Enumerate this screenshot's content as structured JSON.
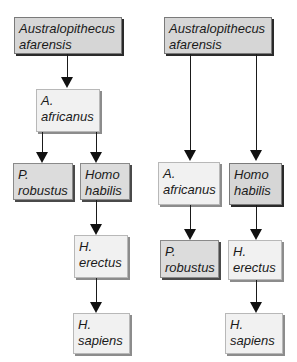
{
  "diagram": {
    "left_tree": {
      "root": {
        "line1": "Australopithecus",
        "line2": "afarensis"
      },
      "africanus": {
        "line1": "A.",
        "line2": "africanus"
      },
      "robustus": {
        "line1": "P.",
        "line2": "robustus"
      },
      "habilis": {
        "line1": "Homo",
        "line2": "habilis"
      },
      "erectus": {
        "line1": "H.",
        "line2": "erectus"
      },
      "sapiens": {
        "line1": "H.",
        "line2": "sapiens"
      },
      "edges": [
        [
          "Australopithecus afarensis",
          "A. africanus"
        ],
        [
          "A. africanus",
          "P. robustus"
        ],
        [
          "A. africanus",
          "Homo habilis"
        ],
        [
          "Homo habilis",
          "H. erectus"
        ],
        [
          "H. erectus",
          "H. sapiens"
        ]
      ]
    },
    "right_tree": {
      "root": {
        "line1": "Australopithecus",
        "line2": "afarensis"
      },
      "africanus": {
        "line1": "A.",
        "line2": "africanus"
      },
      "habilis": {
        "line1": "Homo",
        "line2": "habilis"
      },
      "robustus": {
        "line1": "P.",
        "line2": "robustus"
      },
      "erectus": {
        "line1": "H.",
        "line2": "erectus"
      },
      "sapiens": {
        "line1": "H.",
        "line2": "sapiens"
      },
      "edges": [
        [
          "Australopithecus afarensis",
          "A. africanus"
        ],
        [
          "Australopithecus afarensis",
          "Homo habilis"
        ],
        [
          "A. africanus",
          "P. robustus"
        ],
        [
          "Homo habilis",
          "H. erectus"
        ],
        [
          "H. erectus",
          "H. sapiens"
        ]
      ]
    },
    "colors": {
      "dark_box_fill": "#d6d6d6",
      "light_box_fill": "#f1f1f1",
      "line": "#1a1a1a",
      "background": "#ffffff"
    }
  }
}
